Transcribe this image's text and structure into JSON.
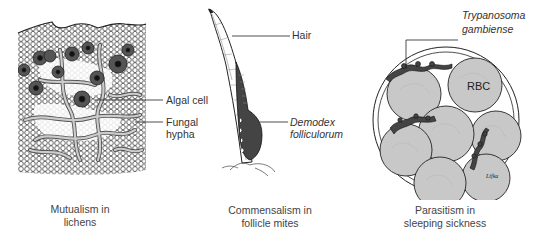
{
  "figure": {
    "panels": [
      {
        "id": "lichens",
        "caption_line1": "Mutualism in",
        "caption_line2": "lichens",
        "labels": {
          "algal_cell": "Algal cell",
          "fungal_hypha_line1": "Fungal",
          "fungal_hypha_line2": "hypha"
        }
      },
      {
        "id": "follicle-mites",
        "caption_line1": "Commensalism in",
        "caption_line2": "follicle mites",
        "labels": {
          "hair": "Hair",
          "demodex_line1": "Demodex",
          "demodex_line2": "folliculorum"
        }
      },
      {
        "id": "sleeping-sickness",
        "caption_line1": "Parasitism in",
        "caption_line2": "sleeping sickness",
        "labels": {
          "trypanosoma_line1": "Trypanosoma",
          "trypanosoma_line2": "gambiense",
          "rbc": "RBC"
        },
        "signature": "Lifka"
      }
    ],
    "colors": {
      "line": "#222222",
      "cell_fill": "#c8c8c8",
      "dark_fill": "#3a3a3a",
      "text": "#333333"
    }
  }
}
